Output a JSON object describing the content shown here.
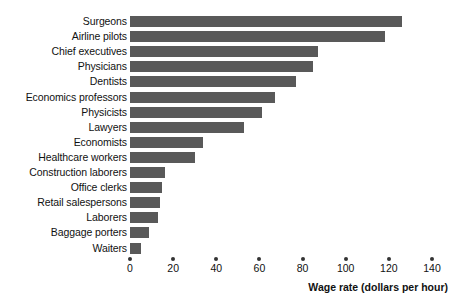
{
  "chart_data": {
    "type": "bar",
    "orientation": "horizontal",
    "title": "",
    "xlabel": "Wage rate (dollars per hour)",
    "ylabel": "",
    "xlim": [
      0,
      140
    ],
    "xticks": [
      0,
      20,
      40,
      60,
      80,
      100,
      120,
      140
    ],
    "grid": false,
    "legend": false,
    "bar_color": "#595959",
    "categories": [
      "Surgeons",
      "Airline pilots",
      "Chief executives",
      "Physicians",
      "Dentists",
      "Economics professors",
      "Physicists",
      "Lawyers",
      "Economists",
      "Healthcare workers",
      "Construction laborers",
      "Office clerks",
      "Retail salespersons",
      "Laborers",
      "Baggage porters",
      "Waiters"
    ],
    "values": [
      126,
      118,
      87,
      85,
      77,
      67,
      61,
      53,
      34,
      30,
      16,
      15,
      14,
      13,
      9,
      5
    ]
  },
  "axis": {
    "title": "Wage rate (dollars per hour)",
    "tick_labels": [
      "0",
      "20",
      "40",
      "60",
      "80",
      "100",
      "120",
      "140"
    ]
  }
}
